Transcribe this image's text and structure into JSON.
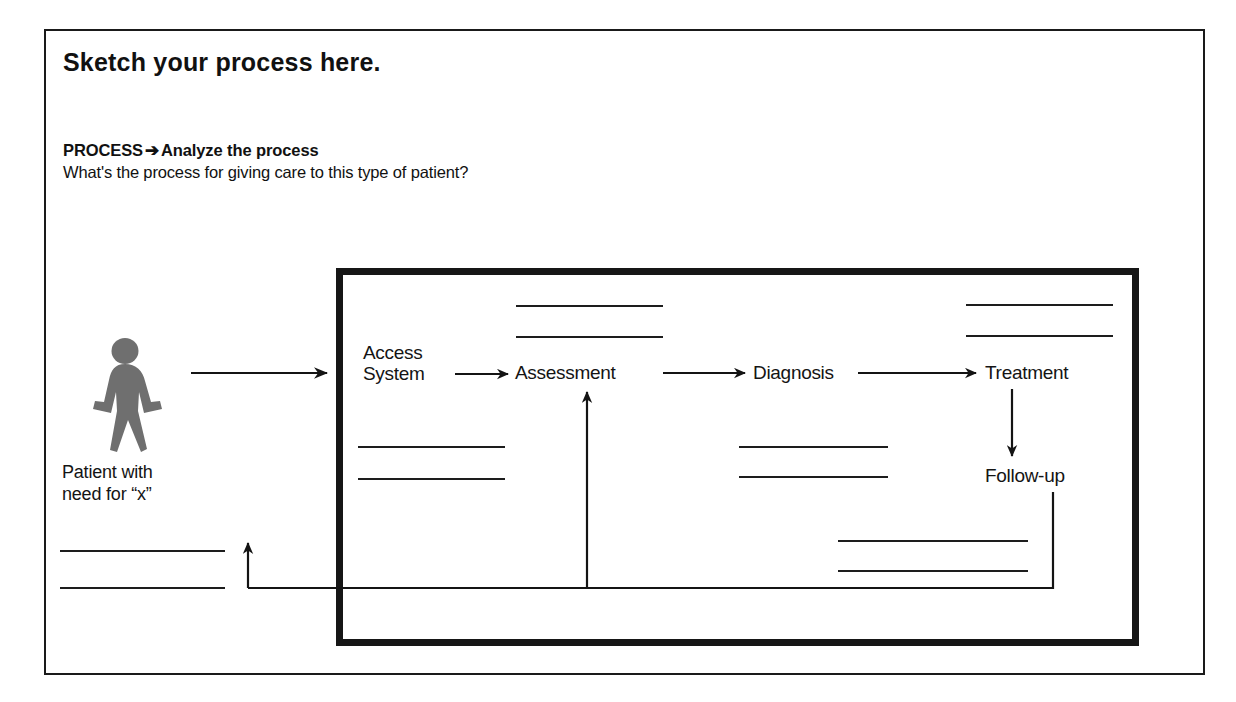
{
  "page": {
    "title": "Sketch your process here.",
    "section_label": "PROCESS",
    "section_arrow": "➔",
    "section_action": "Analyze the process",
    "question": "What's the process for giving care to this type of patient?"
  },
  "diagram": {
    "type": "process-flow",
    "patient": {
      "icon": "walking-person-icon",
      "icon_color": "#6f6f6f",
      "caption_line1": "Patient with",
      "caption_line2": "need for “x”"
    },
    "nodes": [
      {
        "id": "access-system",
        "label_line1": "Access",
        "label_line2": "System"
      },
      {
        "id": "assessment",
        "label_line1": "Assessment",
        "label_line2": ""
      },
      {
        "id": "diagnosis",
        "label_line1": "Diagnosis",
        "label_line2": ""
      },
      {
        "id": "treatment",
        "label_line1": "Treatment",
        "label_line2": ""
      },
      {
        "id": "follow-up",
        "label_line1": "Follow-up",
        "label_line2": ""
      }
    ],
    "connections": [
      {
        "from": "patient",
        "to": "access-system",
        "style": "arrow-right"
      },
      {
        "from": "access-system",
        "to": "assessment",
        "style": "arrow-right"
      },
      {
        "from": "assessment",
        "to": "diagnosis",
        "style": "arrow-right"
      },
      {
        "from": "diagnosis",
        "to": "treatment",
        "style": "arrow-right"
      },
      {
        "from": "treatment",
        "to": "follow-up",
        "style": "arrow-down"
      },
      {
        "from": "follow-up",
        "to": "assessment",
        "style": "feedback-loop-up"
      },
      {
        "from": "follow-up",
        "to": "patient",
        "style": "feedback-loop-left"
      }
    ],
    "blank_write_lines": {
      "count": 12,
      "note": "empty ruled lines for handwritten annotations"
    },
    "colors": {
      "ink": "#141414",
      "frame": "#1a1a1a",
      "process_box": "#161616",
      "figure_gray": "#6f6f6f"
    }
  }
}
